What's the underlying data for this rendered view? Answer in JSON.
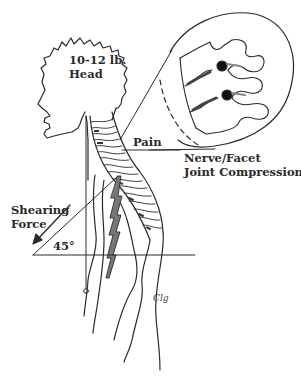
{
  "diagram": {
    "labels": {
      "head_weight_line1": "10-12 lb.",
      "head_weight_line2": "Head",
      "pain": "Pain",
      "compression_line1": "Nerve/Facet",
      "compression_line2": "Joint Compression",
      "shear_line1": "Shearing",
      "shear_line2": "Force",
      "angle": "45°"
    },
    "signature": "Clg",
    "colors": {
      "line": "#2a2a2a",
      "background": "#ffffff",
      "nerve_dot": "#111111",
      "lightning_fill": "#777777"
    },
    "inset": {
      "description": "Magnified vertebrae showing compressed nerve roots",
      "shape": "circle"
    }
  }
}
